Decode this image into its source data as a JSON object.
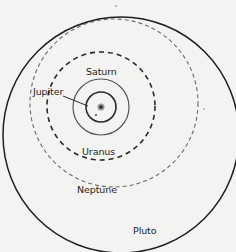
{
  "diagram": {
    "type": "orbital-diagram",
    "sun": {
      "cx": 101,
      "cy": 107,
      "color": "#3a3a3a"
    },
    "orbits": [
      {
        "name": "Jupiter",
        "style": "solid",
        "cx": 101,
        "cy": 107,
        "r": 15,
        "stroke": "#2a2a2a",
        "width": 1.6
      },
      {
        "name": "Saturn",
        "style": "solid",
        "cx": 101,
        "cy": 107,
        "r": 28,
        "stroke": "#555555",
        "width": 1.2
      },
      {
        "name": "Uranus",
        "style": "dashed",
        "cx": 101,
        "cy": 106,
        "r": 54,
        "stroke": "#2a2a2a",
        "width": 1.6
      },
      {
        "name": "Neptune",
        "style": "dashed",
        "cx": 114,
        "cy": 103,
        "r": 84,
        "stroke": "#6a6a6a",
        "width": 1.1
      },
      {
        "name": "Pluto",
        "style": "solid",
        "cx": 121,
        "cy": 135,
        "r": 118,
        "stroke": "#1e1e1e",
        "width": 1.5
      }
    ],
    "labels": {
      "saturn": "Saturn",
      "jupiter": "Jupiter",
      "uranus": "Uranus",
      "neptune": "Neptune",
      "pluto": "Pluto"
    },
    "jupiter_leader": {
      "x1": 63,
      "y1": 96,
      "x2": 88,
      "y2": 106
    },
    "planet_dot": {
      "cx": 96,
      "cy": 115
    }
  }
}
